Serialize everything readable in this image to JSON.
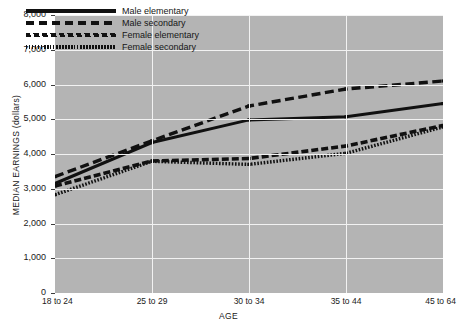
{
  "chart_data": {
    "type": "line",
    "title": "",
    "xlabel": "AGE",
    "ylabel": "MEDIAN EARNINGS (dollars)",
    "categories": [
      "18 to 24",
      "25 to 29",
      "30 to 34",
      "35 to 44",
      "45 to 64"
    ],
    "ylim": [
      0,
      8000
    ],
    "ytick_labels": [
      "0",
      "1,000",
      "2,000",
      "3,000",
      "4,000",
      "5,000",
      "6,000",
      "7,000",
      "8,000"
    ],
    "ytick_values": [
      0,
      1000,
      2000,
      3000,
      4000,
      5000,
      6000,
      7000,
      8000
    ],
    "grid": true,
    "legend_position": "top-left-inside",
    "series": [
      {
        "name": "Male elementary",
        "style": "solid",
        "values": [
          3150,
          4330,
          4980,
          5070,
          5450
        ]
      },
      {
        "name": "Male secondary",
        "style": "dashed",
        "values": [
          3350,
          4380,
          5380,
          5870,
          6100
        ]
      },
      {
        "name": "Female elementary",
        "style": "slanted-dash",
        "values": [
          3080,
          3800,
          3870,
          4230,
          4820
        ]
      },
      {
        "name": "Female secondary",
        "style": "dotted",
        "values": [
          2830,
          3790,
          3700,
          4020,
          4780
        ]
      }
    ]
  },
  "axes": {
    "x_title": "AGE",
    "y_title": "MEDIAN EARNINGS (dollars)"
  },
  "legend": {
    "items": [
      {
        "label": "Male elementary",
        "style": "solid"
      },
      {
        "label": "Male secondary",
        "style": "dashed"
      },
      {
        "label": "Female elementary",
        "style": "slanted-dash"
      },
      {
        "label": "Female secondary",
        "style": "dotted"
      }
    ]
  },
  "colors": {
    "plot_background": "#b4b4b4",
    "gridline": "#f2f2f2",
    "line": "#111111",
    "text": "#1a1a1a",
    "page_background": "#ffffff"
  }
}
